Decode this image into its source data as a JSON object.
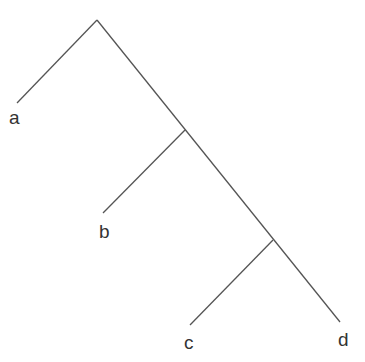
{
  "diagram": {
    "type": "cladogram",
    "line_color": "#555555",
    "label_color": "#333333",
    "nodes": {
      "root": {
        "x": 97,
        "y": 20
      },
      "n1": {
        "x": 185,
        "y": 130
      },
      "n2": {
        "x": 273,
        "y": 240
      }
    },
    "leaves": [
      {
        "id": "a",
        "label": "a",
        "end": {
          "x": 17,
          "y": 103
        },
        "label_pos": {
          "x": 9,
          "y": 108
        }
      },
      {
        "id": "b",
        "label": "b",
        "end": {
          "x": 103,
          "y": 213
        },
        "label_pos": {
          "x": 99,
          "y": 222
        }
      },
      {
        "id": "c",
        "label": "c",
        "end": {
          "x": 190,
          "y": 325
        },
        "label_pos": {
          "x": 184,
          "y": 333
        }
      },
      {
        "id": "d",
        "label": "d",
        "end": {
          "x": 340,
          "y": 322
        },
        "label_pos": {
          "x": 338,
          "y": 330
        }
      }
    ]
  }
}
